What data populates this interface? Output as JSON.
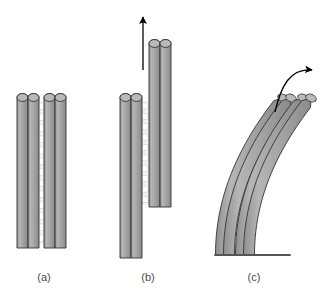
{
  "figure": {
    "background_color": "#ffffff",
    "filament_fill": "#a0a0a0",
    "filament_fill_light": "#b4b4b4",
    "filament_fill_dark": "#8c8c8c",
    "filament_stroke": "#333333",
    "crossbridge_color": "#f2f2f2",
    "crossbridge_stroke": "#d8d8d8",
    "arrow_color": "#000000",
    "base_line_color": "#555555",
    "label_color": "#4a4a4a"
  },
  "panels": [
    {
      "id": "a",
      "label": "(a)",
      "label_x": 44,
      "label_y": 281,
      "state": "resting aligned doublets",
      "has_arrow": false,
      "has_base": false,
      "curved": false,
      "filaments": [
        {
          "name": "left-outer",
          "x": 17,
          "top": 92,
          "bottom": 248,
          "width": 11
        },
        {
          "name": "left-inner",
          "x": 28,
          "top": 92,
          "bottom": 248,
          "width": 11
        },
        {
          "name": "right-inner",
          "x": 44,
          "top": 92,
          "bottom": 248,
          "width": 11
        },
        {
          "name": "right-outer",
          "x": 55,
          "top": 92,
          "bottom": 248,
          "width": 11
        }
      ],
      "crossbridge": {
        "x": 41,
        "top": 101,
        "bottom": 244,
        "rungs": 13
      }
    },
    {
      "id": "b",
      "label": "(b)",
      "label_x": 148,
      "label_y": 281,
      "state": "free sliding, one doublet displaced upward",
      "has_arrow": true,
      "has_base": false,
      "curved": false,
      "arrow": {
        "name": "sliding-direction-arrow",
        "x1": 143,
        "y1": 70,
        "x2": 143,
        "y2": 17,
        "direction": "up"
      },
      "filaments": [
        {
          "name": "left-outer",
          "x": 120,
          "top": 92,
          "bottom": 258,
          "width": 11
        },
        {
          "name": "left-inner",
          "x": 131,
          "top": 92,
          "bottom": 258,
          "width": 11
        },
        {
          "name": "right-inner",
          "x": 149,
          "top": 38,
          "bottom": 207,
          "width": 11
        },
        {
          "name": "right-outer",
          "x": 160,
          "top": 38,
          "bottom": 207,
          "width": 11
        }
      ],
      "crossbridge": {
        "x": 145,
        "top": 101,
        "bottom": 205,
        "rungs": 10
      }
    },
    {
      "id": "c",
      "label": "(c)",
      "label_x": 254,
      "label_y": 281,
      "state": "basal constraint converts sliding into bending",
      "has_arrow": true,
      "has_base": true,
      "curved": true,
      "arrow": {
        "name": "bending-direction-arrow",
        "direction": "up-right-curved",
        "start_x": 275,
        "start_y": 112,
        "end_x": 312,
        "end_y": 70
      },
      "base_line": {
        "name": "basal-anchor",
        "x1": 215,
        "y1": 255,
        "x2": 290,
        "y2": 255
      },
      "filaments": [
        {
          "name": "left-outer",
          "offset": -12
        },
        {
          "name": "left-inner",
          "offset": -4
        },
        {
          "name": "right-inner",
          "offset": 8
        },
        {
          "name": "right-outer",
          "offset": 16
        }
      ],
      "crossbridge": {
        "rungs": 12
      }
    }
  ]
}
